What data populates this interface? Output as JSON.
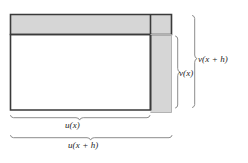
{
  "figure": {
    "colors": {
      "stroke_dark": "#3a3a3a",
      "fill_gray": "#d6d6d6",
      "fill_white": "#ffffff",
      "brace_line": "#8d8d8d",
      "text": "#1c1c1c",
      "background": "#ffffff"
    },
    "labels": {
      "v_x": "v(x)",
      "v_x_plus_h": "v(x + h)",
      "u_x": "u(x)",
      "u_x_plus_h": "u(x + h)"
    },
    "regions": {
      "inner_rectangle": "u(x) by v(x) white rectangle",
      "top_band": "horizontal gray band of height v(x + h) - v(x)",
      "right_band": "vertical gray band of width u(x + h) - u(x)",
      "corner_block": "gray corner square at top right"
    },
    "geometry": {
      "outer_left": 10,
      "outer_top": 14,
      "outer_right": 172,
      "outer_bottom": 113,
      "inner_right": 150,
      "inner_top": 34,
      "inner_bottom": 110,
      "brace_v_x": 178,
      "brace_v_x_plus_h": 195,
      "brace_u_x_y": 117,
      "brace_u_x_plus_h_y": 137
    }
  }
}
